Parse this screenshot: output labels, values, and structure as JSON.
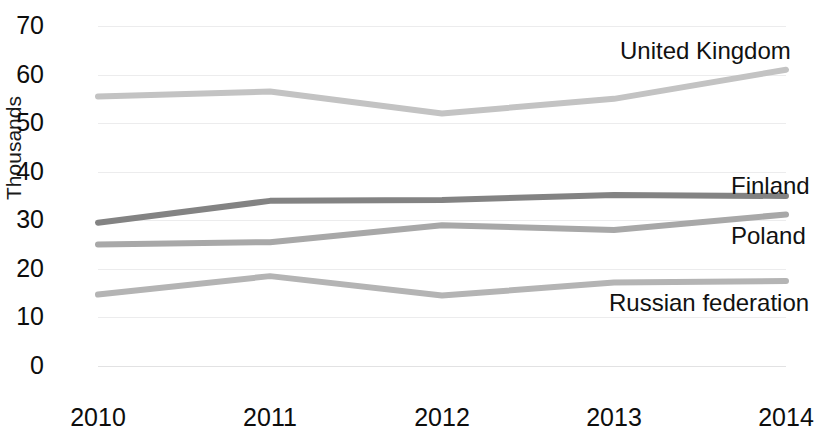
{
  "chart_data": {
    "type": "line",
    "title": "",
    "xlabel": "",
    "ylabel": "Thousands",
    "categories": [
      "2010",
      "2011",
      "2012",
      "2013",
      "2014"
    ],
    "x": [
      2010,
      2011,
      2012,
      2013,
      2014
    ],
    "ylim": [
      0,
      70
    ],
    "ytick_labels": [
      "0",
      "10",
      "20",
      "30",
      "40",
      "50",
      "60",
      "70"
    ],
    "yticks": [
      0,
      10,
      20,
      30,
      40,
      50,
      60,
      70
    ],
    "grid": true,
    "legend_position": "end-of-line-labels",
    "series": [
      {
        "name": "United Kingdom",
        "color": "#c3c3c3",
        "values": [
          55.5,
          56.5,
          52.0,
          55.0,
          61.0
        ]
      },
      {
        "name": "Finland",
        "color": "#838383",
        "values": [
          29.5,
          34.0,
          34.2,
          35.2,
          35.0
        ]
      },
      {
        "name": "Poland",
        "color": "#a8a8a8",
        "values": [
          25.0,
          25.5,
          29.0,
          28.0,
          31.2
        ]
      },
      {
        "name": "Russian federation",
        "color": "#b4b4b4",
        "values": [
          14.7,
          18.5,
          14.5,
          17.2,
          17.5
        ]
      }
    ]
  },
  "axis": {
    "y": {
      "title": "Thousands",
      "labels": [
        "70",
        "60",
        "50",
        "40",
        "30",
        "20",
        "10",
        "0"
      ]
    },
    "x": {
      "labels": [
        "2010",
        "2011",
        "2012",
        "2013",
        "2014"
      ]
    }
  },
  "series_labels": [
    {
      "text": "United Kingdom",
      "left": 620,
      "top": 39
    },
    {
      "text": "Finland",
      "left": 731,
      "top": 174
    },
    {
      "text": "Poland",
      "left": 731,
      "top": 224
    },
    {
      "text": "Russian federation",
      "left": 609,
      "top": 291
    }
  ],
  "colors": {
    "background": "#ffffff",
    "gridline": "#ececed",
    "text": "#0d0d0d"
  }
}
